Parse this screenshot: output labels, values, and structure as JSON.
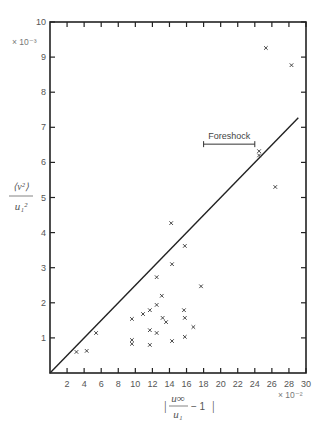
{
  "chart_data": {
    "type": "scatter",
    "title": "",
    "xlabel": "|u∞/u₁ − 1|",
    "ylabel": "⟨v²⟩/u₁²",
    "x_multiplier": "× 10⁻²",
    "y_multiplier": "× 10⁻³",
    "xlim": [
      0,
      30
    ],
    "ylim": [
      0,
      10
    ],
    "xticks": [
      2,
      4,
      6,
      8,
      10,
      12,
      14,
      16,
      18,
      20,
      22,
      24,
      26,
      28,
      30
    ],
    "yticks": [
      1,
      2,
      3,
      4,
      5,
      6,
      7,
      8,
      9,
      10
    ],
    "grid": false,
    "legend": null,
    "series": [
      {
        "name": "observations",
        "marker": "x",
        "points": [
          [
            3.1,
            0.6
          ],
          [
            4.3,
            0.63
          ],
          [
            5.4,
            1.14
          ],
          [
            9.6,
            1.54
          ],
          [
            9.6,
            0.94
          ],
          [
            9.6,
            0.83
          ],
          [
            10.9,
            1.68
          ],
          [
            11.7,
            1.79
          ],
          [
            11.7,
            1.22
          ],
          [
            11.7,
            0.8
          ],
          [
            12.5,
            1.94
          ],
          [
            12.5,
            1.14
          ],
          [
            12.5,
            2.73
          ],
          [
            13.1,
            2.2
          ],
          [
            13.2,
            1.57
          ],
          [
            13.6,
            1.45
          ],
          [
            14.2,
            4.27
          ],
          [
            14.3,
            3.1
          ],
          [
            14.3,
            0.91
          ],
          [
            15.7,
            1.79
          ],
          [
            15.8,
            1.57
          ],
          [
            15.8,
            1.03
          ],
          [
            15.8,
            3.62
          ],
          [
            16.8,
            1.31
          ],
          [
            17.7,
            2.47
          ],
          [
            24.5,
            6.32
          ],
          [
            24.5,
            6.2
          ],
          [
            26.4,
            5.3
          ],
          [
            25.3,
            9.26
          ],
          [
            28.3,
            8.77
          ]
        ]
      },
      {
        "name": "fit line",
        "type": "line",
        "points": [
          [
            0,
            0
          ],
          [
            29.1,
            7.27
          ]
        ]
      }
    ],
    "annotations": [
      {
        "text": "Foreshock",
        "type": "range-bar",
        "x_start": 18,
        "x_end": 24,
        "y": 6.52
      }
    ]
  }
}
